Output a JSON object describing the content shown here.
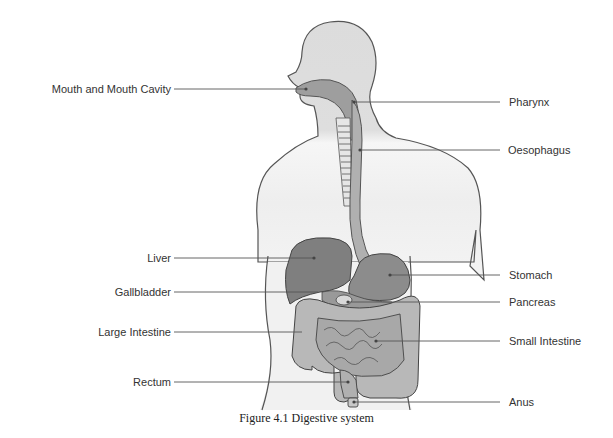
{
  "figure": {
    "caption": "Figure 4.1 Digestive system",
    "colors": {
      "body_fill": "#dcdcdc",
      "body_fill_lower": "#ececec",
      "outline": "#555555",
      "organ_dark": "#7a7a7a",
      "organ_mid": "#9a9a9a",
      "intestine": "#b4b4b4",
      "intestine_light": "#cfcfcf",
      "leader_line": "#555555"
    },
    "labels_left": [
      {
        "text": "Mouth and Mouth Cavity",
        "y": 89
      },
      {
        "text": "Liver",
        "y": 258
      },
      {
        "text": "Gallbladder",
        "y": 292
      },
      {
        "text": "Large Intestine",
        "y": 332
      },
      {
        "text": "Rectum",
        "y": 382
      }
    ],
    "labels_right": [
      {
        "text": "Pharynx",
        "y": 102
      },
      {
        "text": "Oesophagus",
        "y": 150
      },
      {
        "text": "Stomach",
        "y": 275
      },
      {
        "text": "Pancreas",
        "y": 302
      },
      {
        "text": "Small Intestine",
        "y": 341
      },
      {
        "text": "Anus",
        "y": 402
      }
    ]
  }
}
